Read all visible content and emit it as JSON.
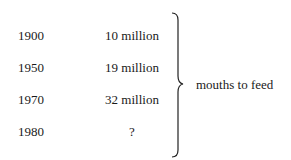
{
  "rows": [
    {
      "year": "1900",
      "value": "10 million"
    },
    {
      "year": "1950",
      "value": "19 million"
    },
    {
      "year": "1970",
      "value": "32 million"
    },
    {
      "year": "1980",
      "value": "?"
    }
  ],
  "brace_label": "mouths to feed",
  "icons": {
    "brace": "right-curly-brace"
  }
}
